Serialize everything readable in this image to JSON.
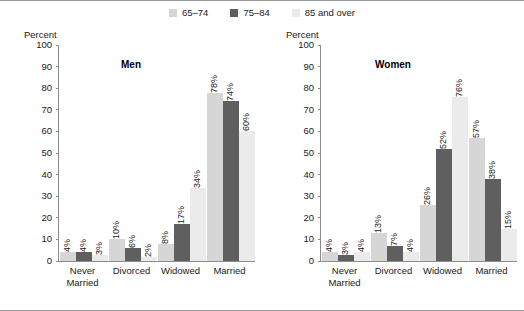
{
  "legend": {
    "items": [
      {
        "label": "65–74",
        "color": "#d6d6d6"
      },
      {
        "label": "75–84",
        "color": "#5f5f5f"
      },
      {
        "label": "85 and over",
        "color": "#ebebeb"
      }
    ]
  },
  "panels": [
    {
      "title": "Men",
      "axis_unit": "Percent"
    },
    {
      "title": "Women",
      "axis_unit": "Percent"
    }
  ],
  "yticks": [
    "100",
    "90",
    "80",
    "70",
    "60",
    "50",
    "40",
    "30",
    "20",
    "10",
    "0"
  ],
  "xlabels": [
    {
      "line1": "Never",
      "line2": "Married"
    },
    {
      "line1": "Divorced",
      "line2": ""
    },
    {
      "line1": "Widowed",
      "line2": ""
    },
    {
      "line1": "Married",
      "line2": ""
    }
  ],
  "chart_data": {
    "type": "bar",
    "title": "",
    "xlabel": "",
    "ylabel": "Percent",
    "ylim": [
      0,
      100
    ],
    "yticks": [
      0,
      10,
      20,
      30,
      40,
      50,
      60,
      70,
      80,
      90,
      100
    ],
    "grid": false,
    "legend_position": "top-center",
    "legend_entries": [
      "65–74",
      "75–84",
      "85 and over"
    ],
    "panels": [
      {
        "name": "Men",
        "categories": [
          "Never Married",
          "Divorced",
          "Widowed",
          "Married"
        ],
        "series": [
          {
            "name": "65–74",
            "values": [
              4,
              10,
              8,
              78
            ],
            "labels": [
              "4%",
              "10%",
              "8%",
              "78%"
            ]
          },
          {
            "name": "75–84",
            "values": [
              4,
              6,
              17,
              74
            ],
            "labels": [
              "4%",
              "6%",
              "17%",
              "74%"
            ]
          },
          {
            "name": "85 and over",
            "values": [
              3,
              2,
              34,
              60
            ],
            "labels": [
              "3%",
              "2%",
              "34%",
              "60%"
            ]
          }
        ]
      },
      {
        "name": "Women",
        "categories": [
          "Never Married",
          "Divorced",
          "Widowed",
          "Married"
        ],
        "series": [
          {
            "name": "65–74",
            "values": [
              4,
              13,
              26,
              57
            ],
            "labels": [
              "4%",
              "13%",
              "26%",
              "57%"
            ]
          },
          {
            "name": "75–84",
            "values": [
              3,
              7,
              52,
              38
            ],
            "labels": [
              "3%",
              "7%",
              "52%",
              "38%"
            ]
          },
          {
            "name": "85 and over",
            "values": [
              4,
              4,
              76,
              15
            ],
            "labels": [
              "4%",
              "4%",
              "76%",
              "15%"
            ]
          }
        ]
      }
    ]
  }
}
